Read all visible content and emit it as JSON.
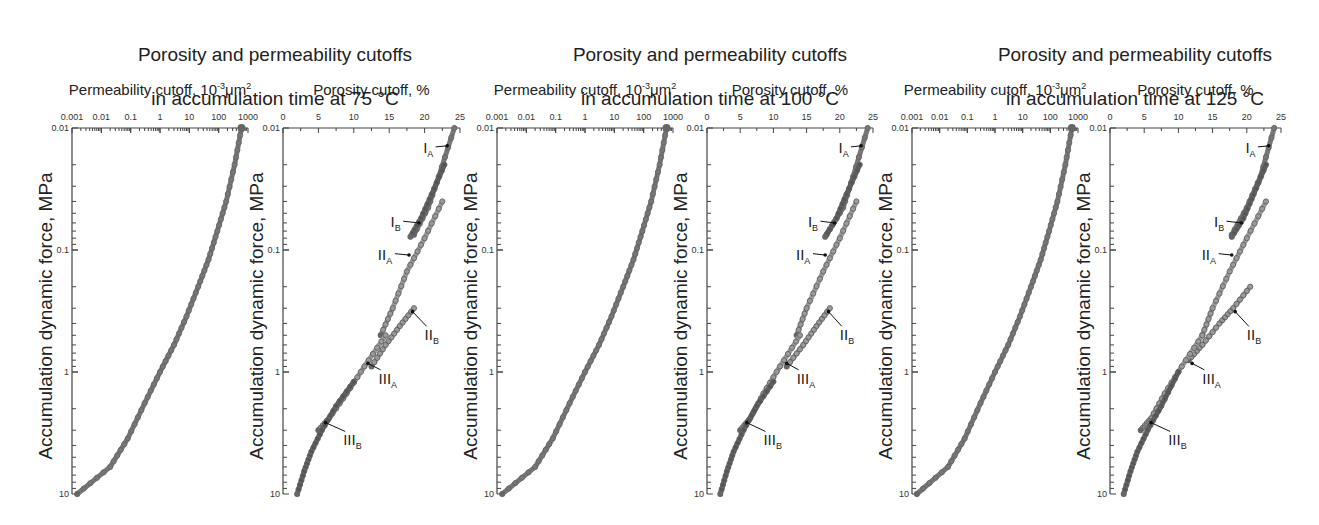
{
  "figure": {
    "groups": [
      {
        "title_line1": "Porosity and permeability cutoffs",
        "title_line2": "in accumulation time at 75 °C",
        "temperature": "75 °C"
      },
      {
        "title_line1": "Porosity and permeability cutoffs",
        "title_line2": "in accumulation time at 100 °C",
        "temperature": "100 °C"
      },
      {
        "title_line1": "Porosity and permeability cutoffs",
        "title_line2": "in accumulation time at 125 °C",
        "temperature": "125 °C"
      }
    ],
    "perm_axis_title": "Permeability cutoff, 10",
    "perm_axis_title_sup": "-3",
    "perm_axis_title_unit": "μm",
    "perm_axis_title_sup2": "2",
    "poro_axis_title": "Porosity cutoff, %",
    "ylabel": "Accumulation dynamic force, MPa",
    "colors": {
      "axis": "#444444",
      "series_dark": "#555555",
      "series_mid": "#777777",
      "series_light": "#9a9a9a",
      "arrow": "#111111"
    }
  },
  "chart_data": [
    {
      "type": "line",
      "title": "Porosity and permeability cutoffs in accumulation time at 75 °C — Permeability",
      "xlabel": "Permeability cutoff, 10^-3 μm^2",
      "ylabel": "Accumulation dynamic force, MPa",
      "xscale": "log",
      "yscale": "log",
      "yinverted": true,
      "xlim": [
        0.001,
        1000
      ],
      "ylim": [
        0.01,
        10
      ],
      "xticks": [
        "0.001",
        "0.01",
        "0.1",
        "1",
        "10",
        "100",
        "1000"
      ],
      "yticks": [
        "0.01",
        "0.1",
        "1",
        "10"
      ],
      "series": [
        {
          "name": "Permeability cutoff",
          "x": [
            600,
            350,
            180,
            90,
            45,
            20,
            8,
            3,
            1,
            0.3,
            0.08,
            0.02,
            0.0015
          ],
          "y": [
            0.01,
            0.02,
            0.04,
            0.07,
            0.12,
            0.2,
            0.35,
            0.6,
            1,
            1.8,
            3.5,
            6,
            10
          ]
        }
      ]
    },
    {
      "type": "line",
      "title": "Porosity and permeability cutoffs in accumulation time at 75 °C — Porosity",
      "xlabel": "Porosity cutoff, %",
      "ylabel": "Accumulation dynamic force, MPa",
      "xscale": "linear",
      "yscale": "log",
      "yinverted": true,
      "xlim": [
        0,
        25
      ],
      "ylim": [
        0.01,
        10
      ],
      "xticks": [
        "0",
        "5",
        "10",
        "15",
        "20",
        "25"
      ],
      "yticks": [
        "0.01",
        "0.1",
        "1",
        "10"
      ],
      "series": [
        {
          "name": "IA",
          "x": [
            24.2,
            22.0,
            20.5,
            18.5
          ],
          "y": [
            0.01,
            0.025,
            0.045,
            0.075
          ]
        },
        {
          "name": "IB",
          "x": [
            22.8,
            21.0,
            19.5,
            18.0
          ],
          "y": [
            0.02,
            0.035,
            0.055,
            0.078
          ]
        },
        {
          "name": "IIA",
          "x": [
            22.5,
            20.0,
            17.5,
            15.5,
            13.8
          ],
          "y": [
            0.04,
            0.08,
            0.15,
            0.3,
            0.5
          ]
        },
        {
          "name": "IIB",
          "x": [
            18.5,
            16.5,
            14.5,
            12.5
          ],
          "y": [
            0.3,
            0.42,
            0.6,
            0.9
          ]
        },
        {
          "name": "IIIA",
          "x": [
            14.5,
            11.5,
            9.0,
            6.5,
            5.0
          ],
          "y": [
            0.5,
            0.9,
            1.5,
            2.4,
            3.0
          ]
        },
        {
          "name": "IIIB",
          "x": [
            10.0,
            7.5,
            5.5,
            4.0,
            3.0,
            2.0
          ],
          "y": [
            1.2,
            1.9,
            3.0,
            4.5,
            6.5,
            10
          ]
        }
      ],
      "annotations": [
        "IA",
        "IB",
        "IIA",
        "IIB",
        "IIIA",
        "IIIB"
      ]
    },
    {
      "type": "line",
      "title": "Porosity and permeability cutoffs in accumulation time at 100 °C — Permeability",
      "xlabel": "Permeability cutoff, 10^-3 μm^2",
      "ylabel": "Accumulation dynamic force, MPa",
      "xscale": "log",
      "yscale": "log",
      "yinverted": true,
      "xlim": [
        0.001,
        1000
      ],
      "ylim": [
        0.01,
        10
      ],
      "xticks": [
        "0.001",
        "0.01",
        "0.1",
        "1",
        "10",
        "100",
        "1000"
      ],
      "yticks": [
        "0.01",
        "0.1",
        "1",
        "10"
      ],
      "series": [
        {
          "name": "Permeability cutoff",
          "x": [
            600,
            350,
            180,
            90,
            45,
            20,
            8,
            3,
            1,
            0.3,
            0.08,
            0.02,
            0.0015
          ],
          "y": [
            0.01,
            0.02,
            0.04,
            0.07,
            0.12,
            0.2,
            0.35,
            0.6,
            1,
            1.8,
            3.5,
            6,
            10
          ]
        }
      ]
    },
    {
      "type": "line",
      "title": "Porosity and permeability cutoffs in accumulation time at 100 °C — Porosity",
      "xlabel": "Porosity cutoff, %",
      "ylabel": "Accumulation dynamic force, MPa",
      "xscale": "linear",
      "yscale": "log",
      "yinverted": true,
      "xlim": [
        0,
        25
      ],
      "ylim": [
        0.01,
        10
      ],
      "xticks": [
        "0",
        "5",
        "10",
        "15",
        "20",
        "25"
      ],
      "yticks": [
        "0.01",
        "0.1",
        "1",
        "10"
      ],
      "series": [
        {
          "name": "IA",
          "x": [
            24.2,
            22.0,
            20.5,
            18.0
          ],
          "y": [
            0.01,
            0.025,
            0.045,
            0.075
          ]
        },
        {
          "name": "IB",
          "x": [
            23.0,
            21.0,
            19.5,
            17.8
          ],
          "y": [
            0.02,
            0.035,
            0.055,
            0.078
          ]
        },
        {
          "name": "IIA",
          "x": [
            22.5,
            20.0,
            17.5,
            15.0,
            13.5
          ],
          "y": [
            0.04,
            0.08,
            0.15,
            0.3,
            0.5
          ]
        },
        {
          "name": "IIB",
          "x": [
            18.5,
            16.5,
            14.5,
            12.0
          ],
          "y": [
            0.3,
            0.42,
            0.6,
            0.9
          ]
        },
        {
          "name": "IIIA",
          "x": [
            14.0,
            11.0,
            8.5,
            6.5,
            5.0
          ],
          "y": [
            0.5,
            0.9,
            1.5,
            2.4,
            3.0
          ]
        },
        {
          "name": "IIIB",
          "x": [
            10.0,
            7.5,
            5.5,
            4.0,
            3.0,
            2.0
          ],
          "y": [
            1.2,
            1.9,
            3.0,
            4.5,
            6.5,
            10
          ]
        }
      ],
      "annotations": [
        "IA",
        "IB",
        "IIA",
        "IIB",
        "IIIA",
        "IIIB"
      ]
    },
    {
      "type": "line",
      "title": "Porosity and permeability cutoffs in accumulation time at 125 °C — Permeability",
      "xlabel": "Permeability cutoff, 10^-3 μm^2",
      "ylabel": "Accumulation dynamic force, MPa",
      "xscale": "log",
      "yscale": "log",
      "yinverted": true,
      "xlim": [
        0.001,
        1000
      ],
      "ylim": [
        0.01,
        10
      ],
      "xticks": [
        "0.001",
        "0.01",
        "0.1",
        "1",
        "10",
        "100",
        "1000"
      ],
      "yticks": [
        "0.01",
        "0.1",
        "1",
        "10"
      ],
      "series": [
        {
          "name": "Permeability cutoff",
          "x": [
            600,
            350,
            180,
            90,
            45,
            20,
            8,
            3,
            1,
            0.3,
            0.08,
            0.02,
            0.0015
          ],
          "y": [
            0.01,
            0.02,
            0.04,
            0.07,
            0.12,
            0.2,
            0.35,
            0.6,
            1,
            1.8,
            3.5,
            6,
            10
          ]
        }
      ]
    },
    {
      "type": "line",
      "title": "Porosity and permeability cutoffs in accumulation time at 125 °C — Porosity",
      "xlabel": "Porosity cutoff, %",
      "ylabel": "Accumulation dynamic force, MPa",
      "xscale": "linear",
      "yscale": "log",
      "yinverted": true,
      "xlim": [
        0,
        25
      ],
      "ylim": [
        0.01,
        10
      ],
      "xticks": [
        "0",
        "5",
        "10",
        "15",
        "20",
        "25"
      ],
      "yticks": [
        "0.01",
        "0.1",
        "1",
        "10"
      ],
      "series": [
        {
          "name": "IA",
          "x": [
            24.0,
            22.0,
            20.0,
            17.8
          ],
          "y": [
            0.01,
            0.025,
            0.045,
            0.075
          ]
        },
        {
          "name": "IB",
          "x": [
            22.8,
            21.0,
            19.5,
            17.8
          ],
          "y": [
            0.02,
            0.035,
            0.055,
            0.078
          ]
        },
        {
          "name": "IIA",
          "x": [
            22.8,
            20.0,
            17.5,
            15.0,
            13.5
          ],
          "y": [
            0.04,
            0.08,
            0.15,
            0.3,
            0.5
          ]
        },
        {
          "name": "IIB",
          "x": [
            20.5,
            18.0,
            16.0,
            13.5,
            11.5
          ],
          "y": [
            0.2,
            0.3,
            0.4,
            0.6,
            0.8
          ]
        },
        {
          "name": "IIIA",
          "x": [
            13.5,
            10.5,
            8.0,
            6.0,
            4.5
          ],
          "y": [
            0.5,
            0.9,
            1.5,
            2.4,
            3.0
          ]
        },
        {
          "name": "IIIB",
          "x": [
            10.0,
            7.5,
            5.5,
            4.0,
            3.0,
            2.0
          ],
          "y": [
            1.0,
            1.9,
            3.0,
            4.5,
            6.5,
            10
          ]
        }
      ],
      "annotations": [
        "IA",
        "IB",
        "IIA",
        "IIB",
        "IIIA",
        "IIIB"
      ]
    }
  ]
}
